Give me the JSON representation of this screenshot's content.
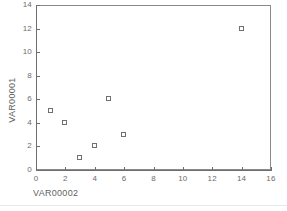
{
  "chart_data": {
    "type": "scatter",
    "title": "",
    "xlabel": "VAR00002",
    "ylabel": "VAR00001",
    "xlim": [
      0,
      16
    ],
    "ylim": [
      0,
      14
    ],
    "xticks": [
      0,
      2,
      4,
      6,
      8,
      10,
      12,
      14,
      16
    ],
    "yticks": [
      0,
      2,
      4,
      6,
      8,
      10,
      12,
      14
    ],
    "xtick_labels": [
      "0",
      "2",
      "4",
      "6",
      "8",
      "10",
      "12",
      "14",
      "16"
    ],
    "ytick_labels": [
      "0",
      "2",
      "4",
      "6",
      "8",
      "10",
      "12",
      "14"
    ],
    "grid": false,
    "legend": null,
    "marker": "open-square",
    "marker_color": "#707070",
    "points": [
      {
        "x": 1,
        "y": 5
      },
      {
        "x": 2,
        "y": 4
      },
      {
        "x": 3,
        "y": 1
      },
      {
        "x": 4,
        "y": 2
      },
      {
        "x": 5,
        "y": 6
      },
      {
        "x": 6,
        "y": 3
      },
      {
        "x": 14,
        "y": 12
      }
    ]
  },
  "colors": {
    "background": "#ffffff",
    "axis": "#6e6e6e",
    "frame": "#8a8a8a",
    "text": "#6b6b6b",
    "title_text": "#5f5f5f"
  }
}
